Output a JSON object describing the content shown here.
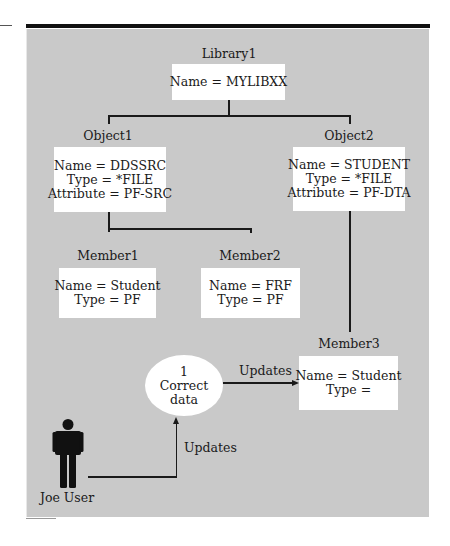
{
  "library": {
    "title": "Library1",
    "lines": [
      "Name = MYLIBXX"
    ]
  },
  "objects": [
    {
      "title": "Object1",
      "lines": [
        "Name = DDSSRC",
        "Type = *FILE",
        "Attribute = PF-SRC"
      ]
    },
    {
      "title": "Object2",
      "lines": [
        "Name = STUDENT",
        "Type = *FILE",
        "Attribute = PF-DTA"
      ]
    }
  ],
  "members": [
    {
      "title": "Member1",
      "lines": [
        "Name = Student",
        "Type = PF"
      ]
    },
    {
      "title": "Member2",
      "lines": [
        "Name = FRF",
        "Type = PF"
      ]
    },
    {
      "title": "Member3",
      "lines": [
        "Name = Student",
        "Type ="
      ]
    }
  ],
  "process": {
    "number": "1",
    "label": "Correct data"
  },
  "flows": {
    "process_to_member3": "Updates",
    "user_to_process": "Updates"
  },
  "actor": {
    "label": "Joe User",
    "icon": "person-icon"
  },
  "colors": {
    "panel_background": "#c9c9c9",
    "box_background": "#ffffff",
    "line_color": "#1a1a1a"
  }
}
